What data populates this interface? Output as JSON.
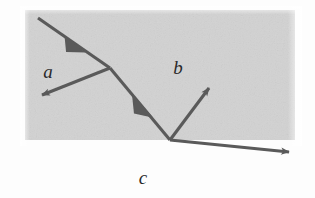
{
  "figure": {
    "type": "optics-ray-diagram",
    "title": "",
    "background_color": "#fdfdfd",
    "medium_fill_color": "#d2d2d2",
    "ray_color": "#5a5a5a",
    "line_color": "#333333",
    "label_color": "#2a2a2a"
  },
  "media": [
    {
      "id": "a",
      "label": "a",
      "label_x": 48,
      "label_y": 78
    },
    {
      "id": "b",
      "label": "b",
      "label_x": 178,
      "label_y": 74
    },
    {
      "id": "c",
      "label": "c",
      "label_x": 143,
      "label_y": 184
    }
  ],
  "slab": {
    "x": 25,
    "y": 10,
    "width": 270,
    "height": 130
  },
  "lines": {
    "normal": {
      "name": "normal-line",
      "x1": 110,
      "y1": 11,
      "x2": 110,
      "y2": 140
    },
    "interface": {
      "name": "interface-line",
      "x1": 25,
      "y1": 140.5,
      "x2": 301,
      "y2": 140.5
    }
  },
  "nodes": {
    "upper_interface_point": {
      "x": 110,
      "y": 68
    },
    "lower_interface_point": {
      "x": 170,
      "y": 140
    }
  },
  "rays": [
    {
      "id": "incident-ray",
      "name": "incident-ray",
      "x1": 38,
      "y1": 18,
      "x2": 110,
      "y2": 68,
      "arrow_position": "middle",
      "arrow_x": 76,
      "arrow_y": 45
    },
    {
      "id": "reflected-ray-upper",
      "name": "reflected-ray-upper",
      "x1": 110,
      "y1": 68,
      "x2": 37,
      "y2": 97,
      "arrow_position": "end",
      "arrow_x": 37,
      "arrow_y": 97
    },
    {
      "id": "refracted-ray",
      "name": "refracted-ray",
      "x1": 110,
      "y1": 68,
      "x2": 170,
      "y2": 140,
      "arrow_position": "middle",
      "arrow_x": 145,
      "arrow_y": 110
    },
    {
      "id": "reflected-ray-lower",
      "name": "reflected-ray-lower",
      "x1": 170,
      "y1": 140,
      "x2": 213,
      "y2": 83,
      "arrow_position": "end",
      "arrow_x": 213,
      "arrow_y": 83
    },
    {
      "id": "transmitted-ray",
      "name": "transmitted-ray",
      "x1": 170,
      "y1": 140,
      "x2": 295,
      "y2": 153,
      "arrow_position": "end",
      "arrow_x": 295,
      "arrow_y": 153
    }
  ]
}
